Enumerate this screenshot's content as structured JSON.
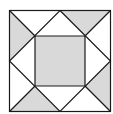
{
  "diagram": {
    "type": "quilt-block",
    "colors": {
      "fill": "#d9d9d9",
      "stroke": "#1a1a1a",
      "background": "#ffffff"
    },
    "outer_square": {
      "x1": 9.5,
      "y1": 10.5,
      "x2": 110.5,
      "y2": 111.5
    },
    "inner_square": {
      "x1": 35,
      "y1": 36,
      "x2": 85,
      "y2": 86
    },
    "shaded_regions": [
      "center-square",
      "top-left-triangle",
      "top-right-triangle",
      "bottom-right-triangle",
      "bottom-left-triangle"
    ]
  }
}
